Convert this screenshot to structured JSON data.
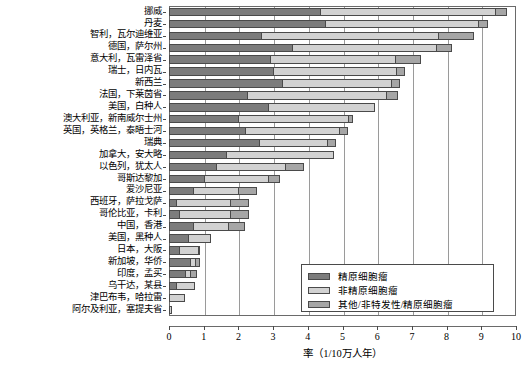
{
  "chart_data": {
    "type": "bar",
    "orientation": "horizontal",
    "stacked": true,
    "title": "",
    "xlabel": "率（1/10万人年）",
    "ylabel": "",
    "xlim": [
      0,
      10
    ],
    "xticks": [
      "0",
      "1",
      "2",
      "3",
      "4",
      "5",
      "6",
      "7",
      "8",
      "9",
      "10"
    ],
    "grid": true,
    "legend_position": "bottom-right",
    "series": [
      {
        "name": "精原细胞瘤",
        "color": "#7c7c7c"
      },
      {
        "name": "非精原细胞瘤",
        "color": "#d2d2d2"
      },
      {
        "name": "其他/非特发性/精原细胞瘤",
        "color": "#a6a6a6"
      }
    ],
    "categories": [
      "挪威",
      "丹麦",
      "智利，瓦尔迪维亚",
      "德国，萨尔州",
      "意大利，瓦雷泽省",
      "瑞士，日内瓦",
      "新西兰",
      "法国，下莱茵省",
      "美国，白种人",
      "澳大利亚，新南威尔士州",
      "英国，英格兰，泰晤士河",
      "瑞典",
      "加拿大，安大略",
      "以色列，犹太人",
      "哥斯达黎加",
      "爱沙尼亚",
      "西班牙，萨拉戈萨",
      "哥伦比亚，卡利",
      "中国，香港",
      "美国，黑种人",
      "日本，大阪",
      "新加坡，华侨",
      "印度，孟买",
      "乌干达，某县",
      "津巴布韦，哈拉雷",
      "阿尔及利亚，塞提夫省"
    ],
    "values": [
      {
        "category": "挪威",
        "seminoma": 4.35,
        "nonseminoma": 5.05,
        "other": 0.35,
        "total": 9.75
      },
      {
        "category": "丹麦",
        "seminoma": 4.5,
        "nonseminoma": 4.4,
        "other": 0.3,
        "total": 9.2
      },
      {
        "category": "智利，瓦尔迪维亚",
        "seminoma": 2.65,
        "nonseminoma": 5.1,
        "other": 1.05,
        "total": 8.8
      },
      {
        "category": "德国，萨尔州",
        "seminoma": 3.55,
        "nonseminoma": 4.15,
        "other": 0.45,
        "total": 8.15
      },
      {
        "category": "意大利，瓦雷泽省",
        "seminoma": 2.9,
        "nonseminoma": 3.6,
        "other": 0.75,
        "total": 7.25
      },
      {
        "category": "瑞士，日内瓦",
        "seminoma": 3.0,
        "nonseminoma": 3.55,
        "other": 0.25,
        "total": 6.8
      },
      {
        "category": "新西兰",
        "seminoma": 3.25,
        "nonseminoma": 3.15,
        "other": 0.25,
        "total": 6.65
      },
      {
        "category": "法国，下莱茵省",
        "seminoma": 2.25,
        "nonseminoma": 4.0,
        "other": 0.35,
        "total": 6.6
      },
      {
        "category": "美国，白种人",
        "seminoma": 2.85,
        "nonseminoma": 3.1,
        "other": 0.0,
        "total": 5.95
      },
      {
        "category": "澳大利亚，新南威尔士州",
        "seminoma": 2.0,
        "nonseminoma": 3.15,
        "other": 0.15,
        "total": 5.3
      },
      {
        "category": "英国，英格兰，泰晤士河",
        "seminoma": 2.2,
        "nonseminoma": 2.7,
        "other": 0.25,
        "total": 5.15
      },
      {
        "category": "瑞典",
        "seminoma": 2.6,
        "nonseminoma": 1.95,
        "other": 0.25,
        "total": 4.8
      },
      {
        "category": "加拿大，安大略",
        "seminoma": 1.65,
        "nonseminoma": 3.1,
        "other": 0.0,
        "total": 4.75
      },
      {
        "category": "以色列，犹太人",
        "seminoma": 1.35,
        "nonseminoma": 2.0,
        "other": 0.55,
        "total": 3.9
      },
      {
        "category": "哥斯达黎加",
        "seminoma": 1.0,
        "nonseminoma": 1.85,
        "other": 0.35,
        "total": 3.2
      },
      {
        "category": "爱沙尼亚",
        "seminoma": 0.7,
        "nonseminoma": 1.3,
        "other": 0.55,
        "total": 2.55
      },
      {
        "category": "西班牙，萨拉戈萨",
        "seminoma": 0.2,
        "nonseminoma": 1.55,
        "other": 0.55,
        "total": 2.3
      },
      {
        "category": "哥伦比亚，卡利",
        "seminoma": 0.3,
        "nonseminoma": 1.45,
        "other": 0.55,
        "total": 2.3
      },
      {
        "category": "中国，香港",
        "seminoma": 0.7,
        "nonseminoma": 1.0,
        "other": 0.5,
        "total": 2.2
      },
      {
        "category": "美国，黑种人",
        "seminoma": 0.55,
        "nonseminoma": 0.65,
        "other": 0.0,
        "total": 1.2
      },
      {
        "category": "日本，大阪",
        "seminoma": 0.3,
        "nonseminoma": 0.55,
        "other": 0.05,
        "total": 0.9
      },
      {
        "category": "新加坡，华侨",
        "seminoma": 0.6,
        "nonseminoma": 0.15,
        "other": 0.15,
        "total": 0.9
      },
      {
        "category": "印度，孟买",
        "seminoma": 0.45,
        "nonseminoma": 0.15,
        "other": 0.2,
        "total": 0.8
      },
      {
        "category": "乌干达，某县",
        "seminoma": 0.2,
        "nonseminoma": 0.55,
        "other": 0.0,
        "total": 0.75
      },
      {
        "category": "津巴布韦，哈拉雷",
        "seminoma": 0.0,
        "nonseminoma": 0.45,
        "other": 0.0,
        "total": 0.45
      },
      {
        "category": "阿尔及利亚，塞提夫省",
        "seminoma": 0.0,
        "nonseminoma": 0.1,
        "other": 0.0,
        "total": 0.1
      }
    ]
  },
  "legend": {
    "items": [
      {
        "label": "精原细胞瘤",
        "key": "seminoma"
      },
      {
        "label": "非精原细胞瘤",
        "key": "nonseminoma"
      },
      {
        "label": "其他/非特发性/精原细胞瘤",
        "key": "other"
      }
    ]
  },
  "axis": {
    "x_title": "率（1/10万人年）",
    "ticks": [
      "0",
      "1",
      "2",
      "3",
      "4",
      "5",
      "6",
      "7",
      "8",
      "9",
      "10"
    ]
  },
  "colors": {
    "seminoma": "#7c7c7c",
    "nonseminoma": "#d2d2d2",
    "other": "#a6a6a6",
    "axis": "#4a4a4a",
    "grid": "#9a9a9a"
  }
}
